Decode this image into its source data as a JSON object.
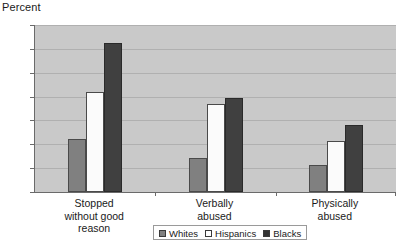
{
  "chart_data": {
    "type": "bar",
    "title": "",
    "xlabel": "",
    "ylabel": "Percent",
    "ylim": [
      0,
      35
    ],
    "ytick_step": 5,
    "yticks": [
      35,
      30,
      25,
      20,
      15,
      10,
      5,
      0
    ],
    "grid": true,
    "legend_position": "bottom-center",
    "categories": [
      "Stopped\nwithout good\nreason",
      "Verbally\nabused",
      "Physically\nabused"
    ],
    "series": [
      {
        "name": "Whites",
        "values": [
          11.2,
          7.2,
          5.6
        ],
        "color": "#808080"
      },
      {
        "name": "Hispanics",
        "values": [
          21.0,
          18.5,
          10.6
        ],
        "color": "#fbfbfb"
      },
      {
        "name": "Blacks",
        "values": [
          31.3,
          19.6,
          14.0
        ],
        "color": "#404040"
      }
    ]
  },
  "axis": {
    "y_title": "Percent",
    "y_ticks": [
      "35",
      "30",
      "25",
      "20",
      "15",
      "10",
      "5",
      "0"
    ]
  },
  "categories": {
    "c0": "Stopped\nwithout good\nreason",
    "c1": "Verbally\nabused",
    "c2": "Physically\nabused"
  },
  "legend": {
    "items": [
      {
        "label": "Whites"
      },
      {
        "label": "Hispanics"
      },
      {
        "label": "Blacks"
      }
    ]
  },
  "colors": {
    "plot_background": "#c9c9c9",
    "gridline": "#b0b0b0",
    "axis": "#6a6a6a",
    "whites": "#808080",
    "hispanics": "#fbfbfb",
    "blacks": "#404040",
    "text": "#1a1a1a"
  }
}
